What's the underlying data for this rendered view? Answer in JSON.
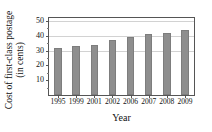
{
  "top_artifact": "· ·",
  "chart_data": {
    "type": "bar",
    "title": "",
    "xlabel": "Year",
    "ylabel_line1": "Cost of first-class postage",
    "ylabel_line2": "(in cents)",
    "categories": [
      "1995",
      "1999",
      "2001",
      "2002",
      "2006",
      "2007",
      "2008",
      "2009"
    ],
    "values": [
      32,
      33,
      34,
      37,
      39,
      41,
      42,
      44
    ],
    "series": [
      {
        "name": "Cost of first-class postage (in cents)",
        "values": [
          32,
          33,
          34,
          37,
          39,
          41,
          42,
          44
        ]
      }
    ],
    "ylim": [
      0,
      52
    ],
    "ytick_labels": [
      "10",
      "20",
      "30",
      "40",
      "50"
    ],
    "ytick_values": [
      10,
      20,
      30,
      40,
      50
    ],
    "yminor_values": [
      5,
      15,
      25,
      35,
      45
    ],
    "gridline_values": [
      30,
      40,
      50
    ],
    "grid": true,
    "legend": "none",
    "bar_color": "#8e8e8e",
    "grid_color": "#d2d2d2",
    "axis_color": "#555555"
  }
}
